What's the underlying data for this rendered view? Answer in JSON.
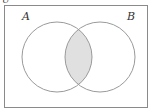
{
  "diagram": {
    "type": "venn",
    "universe_label": "U",
    "sets": [
      {
        "label": "A",
        "cx": 57,
        "cy": 57,
        "r": 35
      },
      {
        "label": "B",
        "cx": 100,
        "cy": 57,
        "r": 35
      }
    ],
    "shaded_region": "A ∩ B",
    "colors": {
      "outline": "#9a9a9a",
      "border": "#8a8a8a",
      "shade": "#e0e0e0",
      "background": "#ffffff"
    }
  }
}
